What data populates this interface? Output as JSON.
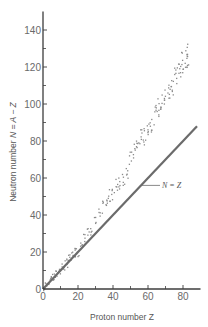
{
  "chart_data": {
    "type": "scatter",
    "title": "",
    "xlabel": "Proton number Z",
    "ylabel": "Neutron number N = A − Z",
    "xlim": [
      0,
      90
    ],
    "ylim": [
      0,
      150
    ],
    "x_ticks": [
      0,
      20,
      40,
      60,
      80
    ],
    "y_ticks": [
      0,
      20,
      40,
      60,
      80,
      100,
      120,
      140
    ],
    "x_minor_ticks": [
      10,
      30,
      50,
      70
    ],
    "y_minor_ticks": [
      10,
      30,
      50,
      70,
      90,
      110,
      130
    ],
    "grid": false,
    "legend": null,
    "annotations": [
      {
        "text": "N = Z",
        "points_to": [
          56,
          56
        ],
        "position": [
          68,
          57
        ]
      }
    ],
    "series": [
      {
        "name": "N = Z",
        "kind": "line",
        "x": [
          0,
          88
        ],
        "y": [
          0,
          88
        ]
      },
      {
        "name": "Stable nuclei",
        "kind": "scatter",
        "x": [
          1,
          2,
          3,
          4,
          5,
          6,
          7,
          8,
          9,
          10,
          11,
          12,
          13,
          14,
          15,
          16,
          17,
          18,
          19,
          20,
          22,
          24,
          26,
          28,
          30,
          32,
          34,
          36,
          38,
          40,
          42,
          44,
          46,
          48,
          50,
          52,
          54,
          56,
          58,
          60,
          62,
          64,
          66,
          68,
          70,
          72,
          74,
          76,
          78,
          80,
          82,
          83
        ],
        "y": [
          0,
          2,
          4,
          5,
          6,
          6,
          7,
          8,
          10,
          10,
          12,
          12,
          14,
          14,
          16,
          16,
          18,
          20,
          20,
          20,
          26,
          28,
          30,
          32,
          36,
          40,
          44,
          46,
          50,
          52,
          56,
          58,
          60,
          64,
          70,
          74,
          78,
          82,
          82,
          88,
          90,
          94,
          98,
          100,
          104,
          106,
          110,
          116,
          118,
          122,
          126,
          126
        ]
      }
    ]
  },
  "labels": {
    "xlabel": "Proton number Z",
    "ylabel_prefix": "Neutron number ",
    "ylabel_formula": "N = A − Z",
    "annotation": "N = Z",
    "x_tick_labels": [
      "0",
      "20",
      "40",
      "60",
      "80"
    ],
    "y_tick_labels": [
      "0",
      "20",
      "40",
      "60",
      "80",
      "100",
      "120",
      "140"
    ]
  },
  "colors": {
    "axis": "#3c3c3c",
    "line": "#6b6b6b",
    "points": "#8a8a8a",
    "text": "#5a5a5a"
  }
}
